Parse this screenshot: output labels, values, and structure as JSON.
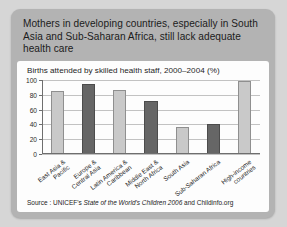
{
  "headline": "Mothers in developing countries, especially in South Asia and Sub-Saharan Africa, still lack adequate health care",
  "source": {
    "prefix": "Source : UNICEF's ",
    "italic": "State of the World's Children 2006",
    "suffix": " and Childinfo.org"
  },
  "colors": {
    "page_background": "#d6d6d6",
    "card_background": "#b3b3b3",
    "panel_background": "#fdfdfd",
    "bar_light": "#c9c9c9",
    "bar_dark": "#666666",
    "gridline": "#c2c2c2",
    "axis": "#6e6e6e",
    "text": "#1b1b1b"
  },
  "chart_data": {
    "type": "bar",
    "title": "Births attended by skilled health staff, 2000–2004 (%)",
    "xlabel": "",
    "ylabel": "",
    "ylim": [
      0,
      100
    ],
    "yticks": [
      0,
      20,
      40,
      60,
      80,
      100
    ],
    "grid": true,
    "legend": "none",
    "categories": [
      "East Asia &\nPacific",
      "Europe &\nCentral Asia",
      "Latin America &\nCaribbean",
      "Middle East &\nNorth Africa",
      "South Asia",
      "Sub-Saharan Africa",
      "High-income\ncountries"
    ],
    "values": [
      85,
      94,
      87,
      71,
      37,
      41,
      98
    ],
    "bar_colors": [
      "light",
      "dark",
      "light",
      "dark",
      "light",
      "dark",
      "light"
    ]
  }
}
